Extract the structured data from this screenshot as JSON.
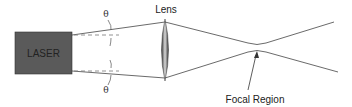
{
  "diagram": {
    "laser_label": "LASER",
    "lens_label": "Lens",
    "angle_top_label": "θ",
    "angle_bottom_label": "θ",
    "focal_label": "Focal Region",
    "colors": {
      "laser_box": "#5a5a5a",
      "line": "#444444",
      "dashed": "#777777",
      "lens_dark": "#3a3a3a",
      "lens_light": "#d8d8d8"
    }
  }
}
